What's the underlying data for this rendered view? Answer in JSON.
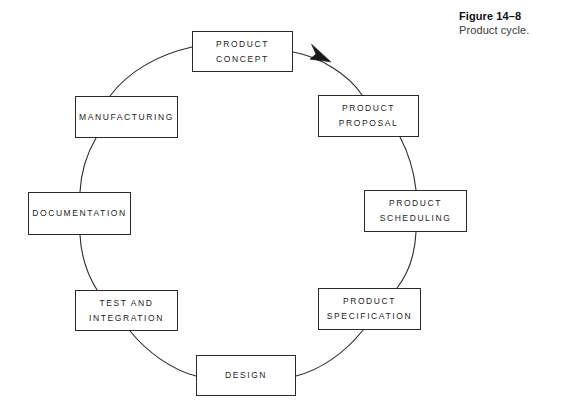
{
  "figure": {
    "number": "Figure 14–8",
    "title": "Product cycle."
  },
  "diagram": {
    "type": "cycle",
    "accent_color": "#2a2a2a",
    "background_color": "#ffffff",
    "nodes": [
      {
        "id": "product-concept",
        "line1": "PRODUCT",
        "line2": "CONCEPT"
      },
      {
        "id": "product-proposal",
        "line1": "PRODUCT",
        "line2": "PROPOSAL"
      },
      {
        "id": "product-scheduling",
        "line1": "PRODUCT",
        "line2": "SCHEDULING"
      },
      {
        "id": "product-specification",
        "line1": "PRODUCT",
        "line2": "SPECIFICATION"
      },
      {
        "id": "design",
        "line1": "DESIGN",
        "line2": ""
      },
      {
        "id": "test-and-integration",
        "line1": "TEST AND",
        "line2": "INTEGRATION"
      },
      {
        "id": "documentation",
        "line1": "DOCUMENTATION",
        "line2": ""
      },
      {
        "id": "manufacturing",
        "line1": "MANUFACTURING",
        "line2": ""
      }
    ],
    "flow_direction": "clockwise",
    "arrow_from": "product-concept",
    "arrow_to": "product-proposal"
  }
}
